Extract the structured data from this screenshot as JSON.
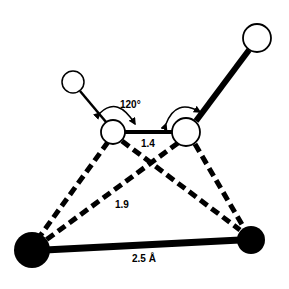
{
  "diagram": {
    "type": "molecular-geometry",
    "background": "#ffffff",
    "ink": "#000000",
    "atoms": [
      {
        "id": "h-left",
        "kind": "open",
        "cx": 73,
        "cy": 82,
        "r": 11
      },
      {
        "id": "h-right",
        "kind": "open",
        "cx": 257,
        "cy": 38,
        "r": 14
      },
      {
        "id": "c-left",
        "kind": "open",
        "cx": 113,
        "cy": 132,
        "r": 12
      },
      {
        "id": "c-right",
        "kind": "open",
        "cx": 186,
        "cy": 132,
        "r": 14
      },
      {
        "id": "metal-left",
        "kind": "filled",
        "cx": 32,
        "cy": 250,
        "r": 18
      },
      {
        "id": "metal-right",
        "kind": "filled",
        "cx": 251,
        "cy": 240,
        "r": 14
      }
    ],
    "labels": {
      "angle": "120°",
      "cc_bond": "1.4",
      "dashed_bond": "1.9",
      "metal_bond": "2.5 Å"
    }
  }
}
